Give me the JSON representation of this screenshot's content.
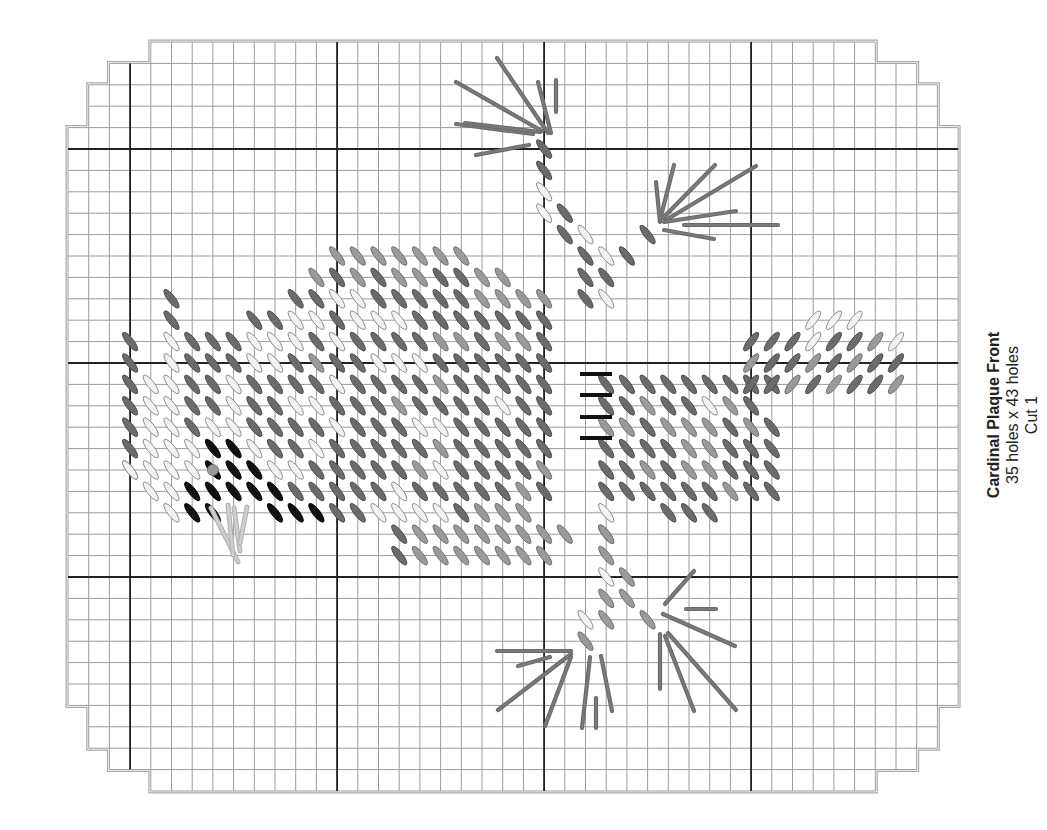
{
  "caption": {
    "title": "Cardinal Plaque Front",
    "size": "35 holes x 43 holes",
    "cut": "Cut 1"
  },
  "grid": {
    "x0": 68,
    "y0": 42,
    "cell_w": 20.7,
    "cell_h": 21.4,
    "cols": 43,
    "rows": 35,
    "major_every": 10,
    "major_col_offset": 3,
    "major_row_offset": 5,
    "row_inset_top": [
      4,
      2,
      1,
      1
    ],
    "row_inset_bottom": [
      4,
      2,
      1,
      1
    ]
  },
  "colors": {
    "dark": "#6b6b6b",
    "medium": "#9a9a9a",
    "light": "#f2f2f2",
    "black": "#111111",
    "outline": "#555555",
    "grid_minor": "#9c9c9c",
    "grid_major": "#222222",
    "border": "#aaaaaa",
    "straight": "#6a6a6a"
  },
  "stitch_rows": {
    "10": ".............MMMMMMM",
    "11": "............MDMDMMDDMM",
    "12": ".....D.....DDLLDDDDDMMMM",
    "13": ".....D...DDLLDLLLDDDDDDD.....................",
    "14": "...D.LDDDLLLDLDDDDMMDMMD......",
    "15": "...D.LDDDLLDMDDLLLDDDDDD.....",
    "16": "...DLLDDLDDDDLDDDDMDDDDD..DDDDDDDDD",
    "17": "...DLLDDLDDLLDDDMDDDDLDD..DDMDDLMD",
    "18": "...DLLDLLDDDDLDDDLLDDDDD..MMDMMMDMD",
    "19": "...DLLLBBLDDLDDDDDMDDDDD..DDDDMMDDD",
    "20": "...LLLLBBBLLDDDDDMLDDDDM..DDMDMMDDD",
    "21": "....LLBBBBBDDDDDLDDDDDMD..DDDDDDMDD",
    "22": ".....LBB..BBBDDLLLLDMMM......DDD...",
    "23": "................DMMMMMMMM.D..........",
    "24": "................DMMMMMMM...."
  },
  "tail_rows": {
    "note": "right-leaning stitches at top of tail",
    "13": {
      "start": 36,
      "cells": "LLL"
    },
    "14": {
      "start": 33,
      "cells": "DDDLDDML"
    },
    "15": {
      "start": 33,
      "cells": "MDDMDMDD"
    },
    "16": {
      "start": 33,
      "cells": "DDMDMDDM"
    }
  },
  "branch_stitches": [
    {
      "c": 23,
      "r": 5,
      "t": "D"
    },
    {
      "c": 23,
      "r": 6,
      "t": "D"
    },
    {
      "c": 23,
      "r": 7,
      "t": "L"
    },
    {
      "c": 23,
      "r": 8,
      "t": "L"
    },
    {
      "c": 24,
      "r": 8,
      "t": "D"
    },
    {
      "c": 24,
      "r": 9,
      "t": "D"
    },
    {
      "c": 25,
      "r": 9,
      "t": "L"
    },
    {
      "c": 25,
      "r": 10,
      "t": "D"
    },
    {
      "c": 26,
      "r": 10,
      "t": "L"
    },
    {
      "c": 27,
      "r": 10,
      "t": "D"
    },
    {
      "c": 25,
      "r": 11,
      "t": "D"
    },
    {
      "c": 26,
      "r": 11,
      "t": "D"
    },
    {
      "c": 25,
      "r": 12,
      "t": "D"
    },
    {
      "c": 26,
      "r": 12,
      "t": "L"
    },
    {
      "c": 28,
      "r": 9,
      "t": "D"
    },
    {
      "c": 26,
      "r": 24,
      "t": "M"
    },
    {
      "c": 26,
      "r": 25,
      "t": "L"
    },
    {
      "c": 27,
      "r": 25,
      "t": "M"
    },
    {
      "c": 26,
      "r": 26,
      "t": "M"
    },
    {
      "c": 27,
      "r": 26,
      "t": "M"
    },
    {
      "c": 25,
      "r": 27,
      "t": "L"
    },
    {
      "c": 26,
      "r": 27,
      "t": "M"
    },
    {
      "c": 28,
      "r": 27,
      "t": "M"
    },
    {
      "c": 25,
      "r": 28,
      "t": "M"
    },
    {
      "c": 3,
      "r": 20,
      "t": "L"
    },
    {
      "c": 26,
      "r": 23,
      "t": "M"
    },
    {
      "c": 26,
      "r": 22,
      "t": "L"
    }
  ],
  "eye": {
    "c": 7,
    "r": 20,
    "t": "M"
  },
  "bars": [
    {
      "x1": 580,
      "y1": 374,
      "x2": 612,
      "y2": 374
    },
    {
      "x1": 580,
      "y1": 395,
      "x2": 612,
      "y2": 395
    },
    {
      "x1": 580,
      "y1": 417,
      "x2": 612,
      "y2": 417
    },
    {
      "x1": 580,
      "y1": 438,
      "x2": 612,
      "y2": 438
    }
  ],
  "straight_stitches": [
    [
      456,
      82,
      542,
      131
    ],
    [
      497,
      58,
      548,
      133
    ],
    [
      538,
      82,
      551,
      133
    ],
    [
      556,
      80,
      556,
      112
    ],
    [
      456,
      124,
      533,
      134
    ],
    [
      476,
      155,
      529,
      145
    ],
    [
      465,
      123,
      540,
      132
    ],
    [
      656,
      182,
      660,
      222
    ],
    [
      674,
      165,
      660,
      220
    ],
    [
      715,
      165,
      663,
      218
    ],
    [
      756,
      166,
      666,
      220
    ],
    [
      736,
      211,
      664,
      222
    ],
    [
      778,
      225,
      684,
      225
    ],
    [
      714,
      239,
      664,
      230
    ],
    [
      694,
      571,
      665,
      604
    ],
    [
      686,
      609,
      716,
      609
    ],
    [
      663,
      614,
      735,
      646
    ],
    [
      660,
      634,
      660,
      689
    ],
    [
      665,
      636,
      694,
      711
    ],
    [
      668,
      633,
      736,
      710
    ],
    [
      497,
      651,
      571,
      651
    ],
    [
      518,
      666,
      550,
      657
    ],
    [
      498,
      710,
      571,
      654
    ],
    [
      545,
      726,
      571,
      657
    ],
    [
      590,
      657,
      582,
      728
    ],
    [
      601,
      656,
      612,
      711
    ],
    [
      596,
      698,
      596,
      728
    ],
    [
      211,
      508,
      238,
      562
    ],
    [
      228,
      505,
      233,
      555
    ],
    [
      234,
      508,
      240,
      551
    ],
    [
      247,
      507,
      240,
      543
    ]
  ],
  "pale_straight": [
    [
      211,
      508,
      238,
      562
    ],
    [
      228,
      505,
      233,
      555
    ],
    [
      234,
      508,
      240,
      551
    ],
    [
      247,
      507,
      240,
      543
    ]
  ]
}
